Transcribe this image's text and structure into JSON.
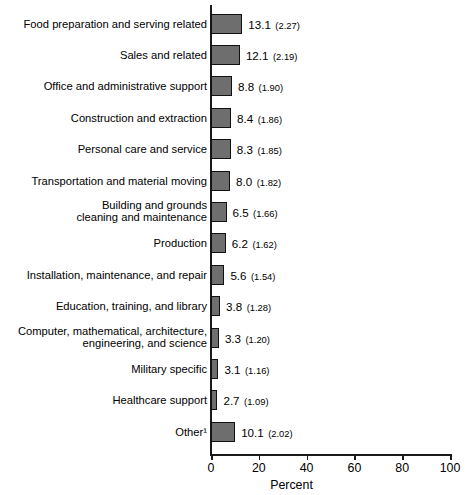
{
  "chart": {
    "type": "bar",
    "orientation": "horizontal",
    "xlabel": "Percent",
    "ylabel": "",
    "title": "",
    "xlim": [
      0,
      100
    ],
    "grid": false,
    "legend": false,
    "bar_color": "#6e6e6e",
    "bar_border_color": "#111111",
    "background": "#ffffff"
  },
  "chart_data": {
    "type": "bar",
    "title": "",
    "xlabel": "Percent",
    "ylabel": "",
    "xlim": [
      0,
      100
    ],
    "xticks": [
      0,
      20,
      40,
      60,
      80,
      100
    ],
    "xtick_labels": [
      "0",
      "20",
      "40",
      "60",
      "80",
      "100"
    ],
    "grid": false,
    "legend_position": "none",
    "orientation": "horizontal",
    "value_format": "percent (standard error)",
    "categories": [
      "Food preparation and serving related",
      "Sales and related",
      "Office and administrative support",
      "Construction and extraction",
      "Personal care and service",
      "Transportation and material moving",
      "Building and grounds\ncleaning and maintenance",
      "Production",
      "Installation, maintenance, and repair",
      "Education, training, and library",
      "Computer, mathematical, architecture,\nengineering, and science",
      "Military specific",
      "Healthcare support",
      "Other¹"
    ],
    "values": [
      13.1,
      12.1,
      8.8,
      8.4,
      8.3,
      8.0,
      6.5,
      6.2,
      5.6,
      3.8,
      3.3,
      3.1,
      2.7,
      10.1
    ],
    "standard_errors": [
      2.27,
      2.19,
      1.9,
      1.86,
      1.85,
      1.82,
      1.66,
      1.62,
      1.54,
      1.28,
      1.2,
      1.16,
      1.09,
      2.02
    ],
    "value_labels": [
      "13.1",
      "12.1",
      "8.8",
      "8.4",
      "8.3",
      "8.0",
      "6.5",
      "6.2",
      "5.6",
      "3.8",
      "3.3",
      "3.1",
      "2.7",
      "10.1"
    ],
    "se_labels": [
      "(2.27)",
      "(2.19)",
      "(1.90)",
      "(1.86)",
      "(1.85)",
      "(1.82)",
      "(1.66)",
      "(1.62)",
      "(1.54)",
      "(1.28)",
      "(1.20)",
      "(1.16)",
      "(1.09)",
      "(2.02)"
    ]
  },
  "rows": [
    {
      "label": "Food preparation and serving related",
      "value": 13.1,
      "value_label": "13.1",
      "se_label": "(2.27)"
    },
    {
      "label": "Sales and related",
      "value": 12.1,
      "value_label": "12.1",
      "se_label": "(2.19)"
    },
    {
      "label": "Office and administrative support",
      "value": 8.8,
      "value_label": "8.8",
      "se_label": "(1.90)"
    },
    {
      "label": "Construction and extraction",
      "value": 8.4,
      "value_label": "8.4",
      "se_label": "(1.86)"
    },
    {
      "label": "Personal care and service",
      "value": 8.3,
      "value_label": "8.3",
      "se_label": "(1.85)"
    },
    {
      "label": "Transportation and material moving",
      "value": 8.0,
      "value_label": "8.0",
      "se_label": "(1.82)"
    },
    {
      "label": "Building and grounds\ncleaning and maintenance",
      "value": 6.5,
      "value_label": "6.5",
      "se_label": "(1.66)"
    },
    {
      "label": "Production",
      "value": 6.2,
      "value_label": "6.2",
      "se_label": "(1.62)"
    },
    {
      "label": "Installation, maintenance, and repair",
      "value": 5.6,
      "value_label": "5.6",
      "se_label": "(1.54)"
    },
    {
      "label": "Education, training, and library",
      "value": 3.8,
      "value_label": "3.8",
      "se_label": "(1.28)"
    },
    {
      "label": "Computer, mathematical, architecture,\nengineering, and science",
      "value": 3.3,
      "value_label": "3.3",
      "se_label": "(1.20)"
    },
    {
      "label": "Military specific",
      "value": 3.1,
      "value_label": "3.1",
      "se_label": "(1.16)"
    },
    {
      "label": "Healthcare support",
      "value": 2.7,
      "value_label": "2.7",
      "se_label": "(1.09)"
    },
    {
      "label": "Other¹",
      "value": 10.1,
      "value_label": "10.1",
      "se_label": "(2.02)"
    }
  ],
  "axis": {
    "ticks": [
      "0",
      "20",
      "40",
      "60",
      "80",
      "100"
    ],
    "title": "Percent"
  }
}
